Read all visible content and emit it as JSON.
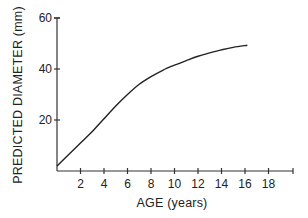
{
  "chart_data": {
    "type": "line",
    "title": "",
    "xlabel": "AGE (years)",
    "ylabel": "PREDICTED DIAMETER (mm)",
    "xlim": [
      0,
      20
    ],
    "ylim": [
      0,
      60
    ],
    "x_ticks": [
      2,
      4,
      6,
      8,
      10,
      12,
      14,
      16,
      18
    ],
    "y_ticks": [
      20,
      40,
      60
    ],
    "grid": false,
    "legend": null,
    "series": [
      {
        "name": "Predicted diameter",
        "x": [
          0,
          1,
          2,
          3,
          4,
          5,
          6,
          7,
          8,
          9,
          10,
          11,
          12,
          13,
          14,
          15,
          16.2
        ],
        "y": [
          2,
          6.5,
          11,
          15.5,
          20.5,
          25.5,
          30,
          34,
          37,
          39.5,
          41.5,
          43.3,
          45,
          46.3,
          47.5,
          48.5,
          49.3
        ]
      }
    ]
  },
  "labels": {
    "x_ticks": [
      "2",
      "4",
      "6",
      "8",
      "10",
      "12",
      "14",
      "16",
      "18"
    ],
    "y_ticks": [
      "20",
      "40",
      "60"
    ],
    "xlabel": "AGE (years)",
    "ylabel": "PREDICTED DIAMETER (mm)"
  }
}
